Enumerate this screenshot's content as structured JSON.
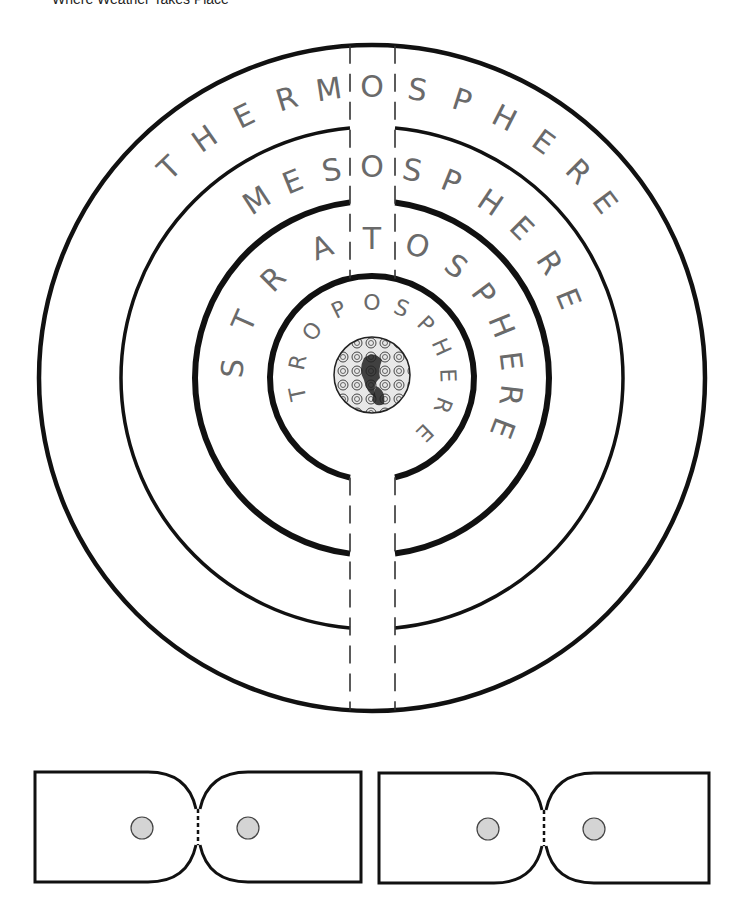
{
  "title": "Where Weather Takes Place",
  "colors": {
    "line": "#111111",
    "letter": "#6a6a6a",
    "hole_fill": "#d4d4d4",
    "background": "#ffffff"
  },
  "wheel": {
    "center": [
      372,
      378
    ],
    "slot_x": [
      350,
      395
    ],
    "layers": [
      {
        "name": "thermosphere",
        "label": "THERMOSPHERE",
        "ring_radius": 333,
        "text_radius": 292,
        "font_size": 30,
        "angles": [
          -44,
          -35,
          -26,
          -17,
          -8.5,
          0,
          9,
          18,
          27,
          36,
          45,
          53
        ]
      },
      {
        "name": "mesosphere",
        "label": "MESOSPHERE",
        "ring_radius": 251,
        "text_radius": 212,
        "font_size": 30,
        "angles": [
          -33,
          -22,
          -11,
          0,
          11,
          22,
          34,
          45,
          57,
          68
        ]
      },
      {
        "name": "stratosphere",
        "label": "STRATOSPHERE",
        "ring_radius": 177,
        "text_radius": 140,
        "font_size": 30,
        "angles": [
          -86,
          -66,
          -45,
          -21,
          0,
          19,
          37,
          53,
          68,
          83,
          97,
          111
        ]
      },
      {
        "name": "troposphere",
        "label": "TROPOSPHERE",
        "ring_radius": 102,
        "text_radius": 76,
        "font_size": 22,
        "angles": [
          -102,
          -78,
          -52,
          -26,
          0,
          23,
          45,
          66,
          88,
          111,
          136
        ]
      }
    ],
    "earth": {
      "label": "earth-globe",
      "radius": 38
    }
  },
  "tabs": [
    {
      "name": "connector-tab-1",
      "x": 35,
      "y": 772,
      "width": 326,
      "height": 110
    },
    {
      "name": "connector-tab-2",
      "x": 379,
      "y": 773,
      "width": 330,
      "height": 110
    }
  ]
}
